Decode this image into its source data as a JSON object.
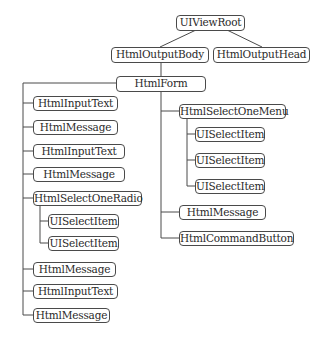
{
  "diagram": {
    "type": "component-tree",
    "nodes": {
      "root": "UIViewRoot",
      "body": "HtmlOutputBody",
      "head": "HtmlOutputHead",
      "form": "HtmlForm",
      "input_text_1": "HtmlInputText",
      "message_1": "HtmlMessage",
      "input_text_2": "HtmlInputText",
      "message_2": "HtmlMessage",
      "select_one_radio": "HtmlSelectOneRadio",
      "radio_item_1": "UISelectItem",
      "radio_item_2": "UISelectItem",
      "message_3": "HtmlMessage",
      "input_text_3": "HtmlInputText",
      "message_4": "HtmlMessage",
      "select_one_menu": "HtmlSelectOneMenu",
      "menu_item_1": "UISelectItem",
      "menu_item_2": "UISelectItem",
      "menu_item_3": "UISelectItem",
      "message_5": "HtmlMessage",
      "command_button": "HtmlCommandButton"
    },
    "edges": [
      [
        "UIViewRoot",
        "HtmlOutputBody"
      ],
      [
        "UIViewRoot",
        "HtmlOutputHead"
      ],
      [
        "HtmlOutputBody",
        "HtmlForm"
      ],
      [
        "HtmlForm",
        "HtmlInputText"
      ],
      [
        "HtmlForm",
        "HtmlMessage"
      ],
      [
        "HtmlForm",
        "HtmlInputText"
      ],
      [
        "HtmlForm",
        "HtmlMessage"
      ],
      [
        "HtmlForm",
        "HtmlSelectOneRadio"
      ],
      [
        "HtmlSelectOneRadio",
        "UISelectItem"
      ],
      [
        "HtmlSelectOneRadio",
        "UISelectItem"
      ],
      [
        "HtmlForm",
        "HtmlMessage"
      ],
      [
        "HtmlForm",
        "HtmlInputText"
      ],
      [
        "HtmlForm",
        "HtmlMessage"
      ],
      [
        "HtmlForm",
        "HtmlSelectOneMenu"
      ],
      [
        "HtmlSelectOneMenu",
        "UISelectItem"
      ],
      [
        "HtmlSelectOneMenu",
        "UISelectItem"
      ],
      [
        "HtmlSelectOneMenu",
        "UISelectItem"
      ],
      [
        "HtmlForm",
        "HtmlMessage"
      ],
      [
        "HtmlForm",
        "HtmlCommandButton"
      ]
    ]
  }
}
